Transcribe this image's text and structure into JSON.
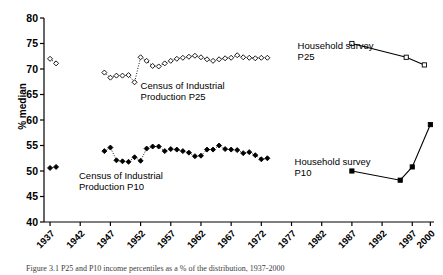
{
  "figure": {
    "caption": "Figure 3.1  P25 and P10 income percentiles as a % of the distribution, 1937-2000"
  },
  "chart_data": {
    "type": "line",
    "title": "",
    "xlabel": "",
    "ylabel": "% median",
    "xlim": [
      1936,
      2000.6
    ],
    "ylim": [
      40,
      80
    ],
    "grid": false,
    "legend": "annotations-inline",
    "ytick_labels": [
      "40",
      "45",
      "50",
      "55",
      "60",
      "65",
      "70",
      "75",
      "80"
    ],
    "yticks": [
      40,
      45,
      50,
      55,
      60,
      65,
      70,
      75,
      80
    ],
    "xtick_labels": [
      "1937",
      "1942",
      "1947",
      "1952",
      "1957",
      "1962",
      "1967",
      "1972",
      "1977",
      "1982",
      "1987",
      "1992",
      "1997",
      "2000"
    ],
    "xticks": [
      1937,
      1942,
      1947,
      1952,
      1957,
      1962,
      1967,
      1972,
      1977,
      1982,
      1987,
      1992,
      1997,
      2000
    ],
    "series": [
      {
        "name": "Census of Industrial Production P25",
        "marker": "open-diamond",
        "line": "dotted",
        "color": "#000000",
        "label_text": "Census of Industrial\nProduction P25",
        "label_x": 1952.0,
        "label_y": 66.1,
        "points": [
          {
            "x": 1937,
            "y": 72.0
          },
          {
            "x": 1938,
            "y": 71.1
          },
          {
            "x": 1946,
            "y": 69.3
          },
          {
            "x": 1947,
            "y": 68.3
          },
          {
            "x": 1948,
            "y": 68.7
          },
          {
            "x": 1949,
            "y": 68.7
          },
          {
            "x": 1950,
            "y": 68.8
          },
          {
            "x": 1951,
            "y": 67.4
          },
          {
            "x": 1952,
            "y": 72.3
          },
          {
            "x": 1953,
            "y": 71.6
          },
          {
            "x": 1954,
            "y": 70.6
          },
          {
            "x": 1955,
            "y": 70.5
          },
          {
            "x": 1956,
            "y": 71.1
          },
          {
            "x": 1957,
            "y": 71.6
          },
          {
            "x": 1958,
            "y": 72.0
          },
          {
            "x": 1959,
            "y": 72.2
          },
          {
            "x": 1960,
            "y": 72.4
          },
          {
            "x": 1961,
            "y": 72.6
          },
          {
            "x": 1962,
            "y": 72.3
          },
          {
            "x": 1963,
            "y": 71.9
          },
          {
            "x": 1964,
            "y": 71.6
          },
          {
            "x": 1965,
            "y": 71.9
          },
          {
            "x": 1966,
            "y": 72.1
          },
          {
            "x": 1967,
            "y": 72.2
          },
          {
            "x": 1968,
            "y": 72.7
          },
          {
            "x": 1969,
            "y": 72.3
          },
          {
            "x": 1970,
            "y": 72.2
          },
          {
            "x": 1971,
            "y": 72.1
          },
          {
            "x": 1972,
            "y": 72.2
          },
          {
            "x": 1973,
            "y": 72.2
          }
        ]
      },
      {
        "name": "Census of Industrial Production P10",
        "marker": "filled-diamond",
        "line": "dotted",
        "color": "#000000",
        "label_text": "Census of Industrial\nProduction P10",
        "label_x": 1941.8,
        "label_y": 48.4,
        "points": [
          {
            "x": 1937,
            "y": 50.6
          },
          {
            "x": 1938,
            "y": 50.8
          },
          {
            "x": 1946,
            "y": 53.9
          },
          {
            "x": 1947,
            "y": 54.6
          },
          {
            "x": 1948,
            "y": 52.1
          },
          {
            "x": 1949,
            "y": 51.9
          },
          {
            "x": 1950,
            "y": 51.8
          },
          {
            "x": 1951,
            "y": 52.7
          },
          {
            "x": 1952,
            "y": 52.0
          },
          {
            "x": 1953,
            "y": 54.4
          },
          {
            "x": 1954,
            "y": 54.8
          },
          {
            "x": 1955,
            "y": 54.8
          },
          {
            "x": 1956,
            "y": 53.9
          },
          {
            "x": 1957,
            "y": 54.3
          },
          {
            "x": 1958,
            "y": 54.2
          },
          {
            "x": 1959,
            "y": 53.9
          },
          {
            "x": 1960,
            "y": 53.6
          },
          {
            "x": 1961,
            "y": 52.9
          },
          {
            "x": 1962,
            "y": 53.0
          },
          {
            "x": 1963,
            "y": 54.2
          },
          {
            "x": 1964,
            "y": 54.2
          },
          {
            "x": 1965,
            "y": 55.0
          },
          {
            "x": 1966,
            "y": 54.3
          },
          {
            "x": 1967,
            "y": 54.2
          },
          {
            "x": 1968,
            "y": 54.1
          },
          {
            "x": 1969,
            "y": 53.5
          },
          {
            "x": 1970,
            "y": 53.7
          },
          {
            "x": 1971,
            "y": 53.1
          },
          {
            "x": 1972,
            "y": 52.3
          },
          {
            "x": 1973,
            "y": 52.5
          }
        ]
      },
      {
        "name": "Household survey P25",
        "marker": "open-square",
        "line": "solid",
        "color": "#000000",
        "label_text": "Household survey\nP25",
        "label_x": 1978.0,
        "label_y": 74.0,
        "points": [
          {
            "x": 1987,
            "y": 75.0
          },
          {
            "x": 1996,
            "y": 72.3
          },
          {
            "x": 1999,
            "y": 70.8
          }
        ]
      },
      {
        "name": "Household survey P10",
        "marker": "filled-square",
        "line": "solid",
        "color": "#000000",
        "label_text": "Household survey\nP10",
        "label_x": 1977.5,
        "label_y": 51.2,
        "points": [
          {
            "x": 1987,
            "y": 50.0
          },
          {
            "x": 1995,
            "y": 48.2
          },
          {
            "x": 1997,
            "y": 50.8
          },
          {
            "x": 2000,
            "y": 59.1
          }
        ]
      }
    ]
  }
}
